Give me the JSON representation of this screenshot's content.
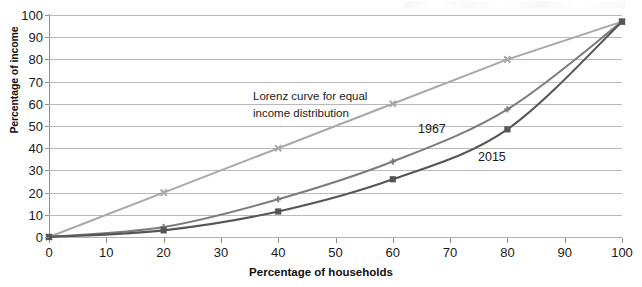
{
  "chart_data": {
    "type": "line",
    "title": "",
    "xlabel": "Percentage of households",
    "ylabel": "Percentage of income",
    "xlim": [
      0,
      100
    ],
    "ylim": [
      0,
      100
    ],
    "xticks": [
      0,
      10,
      20,
      30,
      40,
      50,
      60,
      70,
      80,
      90,
      100
    ],
    "yticks": [
      0,
      10,
      20,
      30,
      40,
      50,
      60,
      70,
      80,
      90,
      100
    ],
    "grid": "horizontal",
    "legend_position": "inline-annotations",
    "x": [
      0,
      20,
      40,
      60,
      80,
      100
    ],
    "series": [
      {
        "name": "Lorenz curve for equal income distribution",
        "values": [
          0,
          20,
          40,
          60,
          80,
          97
        ],
        "color": "#a8a8a8",
        "marker": "x"
      },
      {
        "name": "1967",
        "values": [
          0,
          4.5,
          17,
          34,
          57.5,
          97
        ],
        "color": "#7c7c7c",
        "marker": "plus"
      },
      {
        "name": "2015",
        "values": [
          0,
          3,
          11.5,
          26,
          48.5,
          97
        ],
        "color": "#565656",
        "marker": "square"
      }
    ],
    "annotations": [
      {
        "text_line1": "Lorenz curve for equal",
        "text_line2": "income distribution"
      },
      {
        "text": "1967"
      },
      {
        "text": "2015"
      }
    ]
  },
  "axis": {
    "x_title": "Percentage of households",
    "y_title": "Percentage of income",
    "x_tick_labels": [
      "0",
      "10",
      "20",
      "30",
      "40",
      "50",
      "60",
      "70",
      "80",
      "90",
      "100"
    ],
    "y_tick_labels": [
      "0",
      "10",
      "20",
      "30",
      "40",
      "50",
      "60",
      "70",
      "80",
      "90",
      "100"
    ]
  },
  "annotations": {
    "equality_line1": "Lorenz curve for equal",
    "equality_line2": "income distribution",
    "series_1967": "1967",
    "series_2015": "2015"
  },
  "colors": {
    "equality": "#a8a8a8",
    "curve_1967": "#7c7c7c",
    "curve_2015": "#565656",
    "gridline": "#b9b9b9",
    "axis": "#8f8f8f",
    "text": "#1a1a1a"
  }
}
